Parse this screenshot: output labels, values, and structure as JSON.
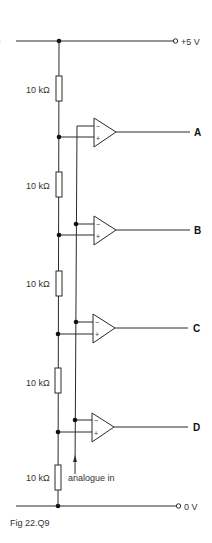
{
  "diagram": {
    "type": "circuit",
    "part_marker": ")",
    "supply_top": {
      "label": "+5 V"
    },
    "supply_bottom": {
      "label": "0 V"
    },
    "resistors": [
      {
        "label": "10 kΩ"
      },
      {
        "label": "10 kΩ"
      },
      {
        "label": "10 kΩ"
      },
      {
        "label": "10 kΩ"
      },
      {
        "label": "10 kΩ"
      }
    ],
    "comparators": [
      {
        "output": "A",
        "inverting": "−",
        "non_inverting": "+"
      },
      {
        "output": "B",
        "inverting": "−",
        "non_inverting": "+"
      },
      {
        "output": "C",
        "inverting": "−",
        "non_inverting": "+"
      },
      {
        "output": "D",
        "inverting": "−",
        "non_inverting": "+"
      }
    ],
    "input_label": "analogue in",
    "caption": "Fig 22.Q9"
  }
}
